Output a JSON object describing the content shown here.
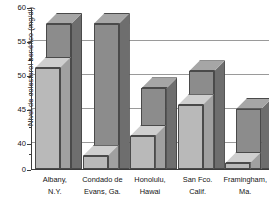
{
  "chart_data": {
    "type": "bar",
    "title": "",
    "subtitle": "",
    "xlabel": "",
    "ylabel": "Nivel de colesterol benéfico (mg/dl)",
    "ylim": [
      0,
      60
    ],
    "y_axis_break": true,
    "y_axis_break_note": "Eje interrumpido: salto de 0 a ~37; escala lineal de 37 a 60",
    "yticks_major": [
      0,
      40,
      45,
      50,
      55,
      60
    ],
    "ytick_labels": [
      "0",
      "40",
      "45",
      "50",
      "55",
      "60"
    ],
    "yticks_minor": [
      38.5,
      42.5,
      47.5,
      52.5,
      57.5
    ],
    "grid": true,
    "grid_axis": "y",
    "legend": "none",
    "legend_position": "none",
    "categories": [
      "Albany,\nN.Y.",
      "Condado de\nEvans, Ga.",
      "Honolulu,\nHawai",
      "San Fco.\nCalif.",
      "Framingham,\nMa."
    ],
    "series": [
      {
        "name": "front",
        "color": "#b9b9b9",
        "values": [
          51.0,
          38.0,
          41.0,
          45.5,
          37.0
        ]
      },
      {
        "name": "rear",
        "color": "#8c8c8c",
        "values": [
          57.5,
          57.5,
          48.0,
          50.5,
          45.0
        ],
        "clipped_note": "Las dos primeras barras traseras sobrepasan el tope del eje (60)"
      }
    ],
    "annotations": []
  },
  "axis": {
    "y_title": "Nivel de colesterol benéfico (mg/dl)"
  },
  "labels": {
    "y": [
      "60",
      "55",
      "50",
      "45",
      "40",
      "0"
    ],
    "x": [
      "Albany,\nN.Y.",
      "Condado de\nEvans, Ga.",
      "Honolulu,\nHawai",
      "San Fco.\nCalif.",
      "Framingham,\nMa."
    ]
  }
}
